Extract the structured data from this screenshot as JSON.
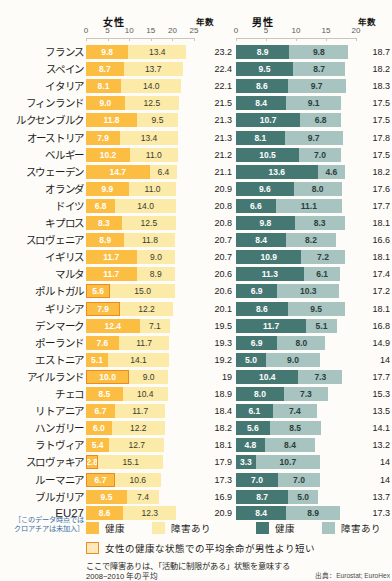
{
  "header": {
    "female_title": "女性",
    "male_title": "男性",
    "years_label_female": "年数",
    "years_label_male": "年数",
    "female_axis_ticks": [
      "0",
      "5",
      "10",
      "15",
      "20",
      "25"
    ],
    "male_axis_ticks": [
      "0",
      "5",
      "10",
      "15",
      "20"
    ]
  },
  "legend": {
    "female_healthy": "健康",
    "female_disabled": "障害あり",
    "male_healthy": "健康",
    "male_disabled": "障害あり",
    "highlight_note": "女性の健康な状態での平均余命が男性より短い",
    "footnote": "ここで障害ありは、「活動に制限がある」状態を意味する",
    "period": "2008−2010 年の平均",
    "source": "出典：Eurostat; EuroHex"
  },
  "notes": {
    "eu27_note_line1": "［このデータ時点では",
    "eu27_note_line2": "クロアチアは未加入］"
  },
  "colors": {
    "female_healthy": "#fbbd42",
    "female_disabled": "#fbeaa8",
    "male_healthy": "#457873",
    "male_disabled": "#a7c4c0",
    "highlight_border": "#f08a1d"
  },
  "chart_data": {
    "type": "bar",
    "subtype": "stacked-horizontal-paired",
    "xlabel": "年数",
    "ylabel": "",
    "female_xlim": [
      0,
      25
    ],
    "male_xlim": [
      0,
      20
    ],
    "grid": false,
    "legend_position": "bottom",
    "series": [
      {
        "name": "女性 健康",
        "color": "#fbbd42"
      },
      {
        "name": "女性 障害あり",
        "color": "#fbeaa8"
      },
      {
        "name": "男性 健康",
        "color": "#457873"
      },
      {
        "name": "男性 障害あり",
        "color": "#a7c4c0"
      }
    ],
    "categories": [
      "フランス",
      "スペイン",
      "イタリア",
      "フィンランド",
      "ルクセンブルク",
      "オーストリア",
      "ベルギー",
      "スウェーデン",
      "オランダ",
      "ドイツ",
      "キプロス",
      "スロヴェニア",
      "イギリス",
      "マルタ",
      "ポルトガル",
      "ギリシア",
      "デンマーク",
      "ポーランド",
      "エストニア",
      "アイルランド",
      "チェコ",
      "リトアニア",
      "ハンガリー",
      "ラトヴィア",
      "スロヴァキア",
      "ルーマニア",
      "ブルガリア",
      "EU27"
    ],
    "rows": [
      {
        "country": "フランス",
        "f_healthy": 9.8,
        "f_disabled": 13.4,
        "f_total": 23.2,
        "m_healthy": 8.9,
        "m_disabled": 9.8,
        "m_total": 18.7,
        "highlight": false
      },
      {
        "country": "スペイン",
        "f_healthy": 8.7,
        "f_disabled": 13.7,
        "f_total": 22.4,
        "m_healthy": 9.5,
        "m_disabled": 8.7,
        "m_total": 18.2,
        "highlight": false
      },
      {
        "country": "イタリア",
        "f_healthy": 8.1,
        "f_disabled": 14.0,
        "f_total": 22.1,
        "m_healthy": 8.6,
        "m_disabled": 9.7,
        "m_total": 18.3,
        "highlight": false
      },
      {
        "country": "フィンランド",
        "f_healthy": 9.0,
        "f_disabled": 12.5,
        "f_total": 21.5,
        "m_healthy": 8.4,
        "m_disabled": 9.1,
        "m_total": 17.5,
        "highlight": false
      },
      {
        "country": "ルクセンブルク",
        "f_healthy": 11.8,
        "f_disabled": 9.5,
        "f_total": 21.3,
        "m_healthy": 10.7,
        "m_disabled": 6.8,
        "m_total": 17.5,
        "highlight": false
      },
      {
        "country": "オーストリア",
        "f_healthy": 7.9,
        "f_disabled": 13.4,
        "f_total": 21.3,
        "m_healthy": 8.1,
        "m_disabled": 9.7,
        "m_total": 17.8,
        "highlight": false
      },
      {
        "country": "ベルギー",
        "f_healthy": 10.2,
        "f_disabled": 11.0,
        "f_total": 21.2,
        "m_healthy": 10.5,
        "m_disabled": 7.0,
        "m_total": 17.5,
        "highlight": false
      },
      {
        "country": "スウェーデン",
        "f_healthy": 14.7,
        "f_disabled": 6.4,
        "f_total": 21.1,
        "m_healthy": 13.6,
        "m_disabled": 4.6,
        "m_total": 18.2,
        "highlight": false
      },
      {
        "country": "オランダ",
        "f_healthy": 9.9,
        "f_disabled": 11.0,
        "f_total": 20.9,
        "m_healthy": 9.6,
        "m_disabled": 8.0,
        "m_total": 17.6,
        "highlight": false
      },
      {
        "country": "ドイツ",
        "f_healthy": 6.8,
        "f_disabled": 14.0,
        "f_total": 20.8,
        "m_healthy": 6.6,
        "m_disabled": 11.1,
        "m_total": 17.7,
        "highlight": false
      },
      {
        "country": "キプロス",
        "f_healthy": 8.3,
        "f_disabled": 12.5,
        "f_total": 20.8,
        "m_healthy": 9.8,
        "m_disabled": 8.3,
        "m_total": 18.1,
        "highlight": false
      },
      {
        "country": "スロヴェニア",
        "f_healthy": 8.9,
        "f_disabled": 11.8,
        "f_total": 20.7,
        "m_healthy": 8.4,
        "m_disabled": 8.2,
        "m_total": 16.6,
        "highlight": false
      },
      {
        "country": "イギリス",
        "f_healthy": 11.7,
        "f_disabled": 9.0,
        "f_total": 20.7,
        "m_healthy": 10.9,
        "m_disabled": 7.2,
        "m_total": 18.1,
        "highlight": false
      },
      {
        "country": "マルタ",
        "f_healthy": 11.7,
        "f_disabled": 8.9,
        "f_total": 20.6,
        "m_healthy": 11.3,
        "m_disabled": 6.1,
        "m_total": 17.4,
        "highlight": false
      },
      {
        "country": "ポルトガル",
        "f_healthy": 5.6,
        "f_disabled": 15.0,
        "f_total": 20.6,
        "m_healthy": 6.9,
        "m_disabled": 10.3,
        "m_total": 17.2,
        "highlight": true
      },
      {
        "country": "ギリシア",
        "f_healthy": 7.9,
        "f_disabled": 12.2,
        "f_total": 20.1,
        "m_healthy": 8.6,
        "m_disabled": 9.5,
        "m_total": 18.1,
        "highlight": true
      },
      {
        "country": "デンマーク",
        "f_healthy": 12.4,
        "f_disabled": 7.1,
        "f_total": 19.5,
        "m_healthy": 11.7,
        "m_disabled": 5.1,
        "m_total": 16.8,
        "highlight": false
      },
      {
        "country": "ポーランド",
        "f_healthy": 7.6,
        "f_disabled": 11.7,
        "f_total": 19.3,
        "m_healthy": 6.9,
        "m_disabled": 8.0,
        "m_total": 14.9,
        "highlight": false
      },
      {
        "country": "エストニア",
        "f_healthy": 5.1,
        "f_disabled": 14.1,
        "f_total": 19.2,
        "m_healthy": 5.0,
        "m_disabled": 9.0,
        "m_total": 14,
        "highlight": false
      },
      {
        "country": "アイルランド",
        "f_healthy": 10.0,
        "f_disabled": 9.0,
        "f_total": 19,
        "m_healthy": 10.4,
        "m_disabled": 7.3,
        "m_total": 17.7,
        "highlight": true
      },
      {
        "country": "チェコ",
        "f_healthy": 8.5,
        "f_disabled": 10.4,
        "f_total": 18.9,
        "m_healthy": 8.0,
        "m_disabled": 7.3,
        "m_total": 15.3,
        "highlight": false
      },
      {
        "country": "リトアニア",
        "f_healthy": 6.7,
        "f_disabled": 11.7,
        "f_total": 18.4,
        "m_healthy": 6.1,
        "m_disabled": 7.4,
        "m_total": 13.5,
        "highlight": false
      },
      {
        "country": "ハンガリー",
        "f_healthy": 6.0,
        "f_disabled": 12.2,
        "f_total": 18.2,
        "m_healthy": 5.6,
        "m_disabled": 8.5,
        "m_total": 14.1,
        "highlight": false
      },
      {
        "country": "ラトヴィア",
        "f_healthy": 5.4,
        "f_disabled": 12.7,
        "f_total": 18.1,
        "m_healthy": 4.8,
        "m_disabled": 8.4,
        "m_total": 13.2,
        "highlight": false
      },
      {
        "country": "スロヴァキア",
        "f_healthy": 2.8,
        "f_disabled": 15.1,
        "f_total": 17.9,
        "m_healthy": 3.3,
        "m_disabled": 10.7,
        "m_total": 14,
        "highlight": true
      },
      {
        "country": "ルーマニア",
        "f_healthy": 6.7,
        "f_disabled": 10.6,
        "f_total": 17.3,
        "m_healthy": 7.0,
        "m_disabled": 7.0,
        "m_total": 14,
        "highlight": true
      },
      {
        "country": "ブルガリア",
        "f_healthy": 9.5,
        "f_disabled": 7.4,
        "f_total": 16.9,
        "m_healthy": 8.7,
        "m_disabled": 5.0,
        "m_total": 13.7,
        "highlight": false
      },
      {
        "country": "EU27",
        "f_healthy": 8.6,
        "f_disabled": 12.3,
        "f_total": 20.9,
        "m_healthy": 8.4,
        "m_disabled": 8.9,
        "m_total": 17.3,
        "highlight": false
      }
    ]
  }
}
